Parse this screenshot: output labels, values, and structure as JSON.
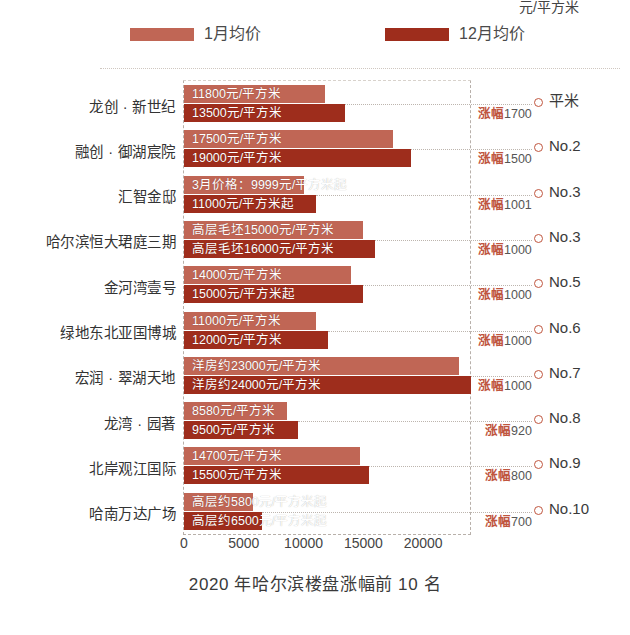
{
  "chart_data": {
    "type": "bar",
    "title": "2020 年哈尔滨楼盘涨幅前 10 名",
    "xlabel": "元/平方米",
    "ylabel": "",
    "orientation": "horizontal",
    "xlim": [
      0,
      24000
    ],
    "xticks": [
      0,
      5000,
      10000,
      15000,
      20000
    ],
    "xtick_labels": [
      "0",
      "5000",
      "10000",
      "15000",
      "20000"
    ],
    "grid": false,
    "legend_position": "top",
    "legend": [
      {
        "name": "1月均价",
        "color": "#c06655"
      },
      {
        "name": "12月均价",
        "color": "#9e2d1c"
      }
    ],
    "categories": [
      "龙创 · 新世纪",
      "融创 · 御湖宸院",
      "汇智金邸",
      "哈尔滨恒大珺庭三期",
      "金河湾壹号",
      "绿地东北亚国博城",
      "宏润 · 翠湖天地",
      "龙湾 · 园著",
      "北岸观江国际",
      "哈南万达广场"
    ],
    "series": [
      {
        "name": "1月均价",
        "color": "#c06655",
        "values": [
          11800,
          17500,
          9999,
          15000,
          14000,
          11000,
          23000,
          8580,
          14700,
          5800
        ],
        "labels": [
          "11800元/平方米",
          "17500元/平方米",
          "3月价格：9999元/平方米起",
          "高层毛坯15000元/平方米",
          "14000元/平方米",
          "11000元/平方米",
          "洋房约23000元/平方米",
          "8580元/平方米",
          "14700元/平方米",
          "高层约5800元/平方米起"
        ]
      },
      {
        "name": "12月均价",
        "color": "#9e2d1c",
        "values": [
          13500,
          19000,
          11000,
          16000,
          15000,
          12000,
          24000,
          9500,
          15500,
          6500
        ],
        "labels": [
          "13500元/平方米",
          "19000元/平方米",
          "11000元/平方米起",
          "高层毛坯16000元/平方米",
          "15000元/平方米起",
          "12000元/平方米",
          "洋房约24000元/平方米",
          "9500元/平方米",
          "15500元/平方米",
          "高层约6500元/平方米起"
        ]
      }
    ],
    "annotations": {
      "growth_prefix": "涨幅",
      "growth_values": [
        1700,
        1500,
        1001,
        1000,
        1000,
        1000,
        1000,
        920,
        800,
        700
      ],
      "rank_labels": [
        "平米",
        "No.2",
        "No.3",
        "No.3",
        "No.5",
        "No.6",
        "No.7",
        "No.8",
        "No.9",
        "No.10"
      ]
    }
  }
}
